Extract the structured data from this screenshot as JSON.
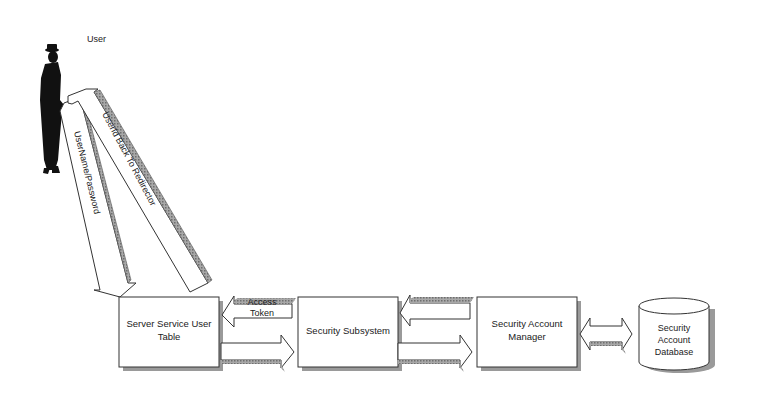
{
  "actor": {
    "label": "User"
  },
  "flows": {
    "credentials": "UserName/Password",
    "redirect": "UserId Back To Redirector",
    "access_token_line1": "Access",
    "access_token_line2": "Token"
  },
  "nodes": {
    "user_table": {
      "line1": "Server Service User",
      "line2": "Table"
    },
    "subsystem": {
      "line1": "Security Subsystem"
    },
    "account_manager": {
      "line1": "Security Account",
      "line2": "Manager"
    },
    "database": {
      "line1": "Security",
      "line2": "Account",
      "line3": "Database"
    }
  },
  "colors": {
    "box_fill": "#ffffff",
    "stroke": "#333333",
    "shadow": "#9a9a9a",
    "arrow_side": "#8c8c8c",
    "silhouette": "#111111"
  }
}
